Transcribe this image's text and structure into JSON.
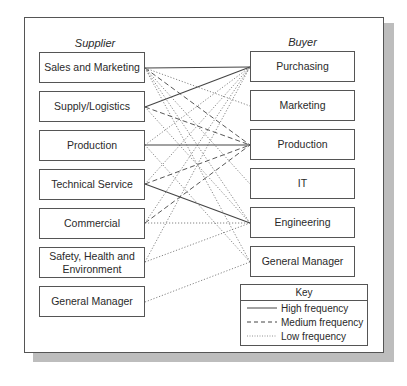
{
  "columns": {
    "supplier_title": "Supplier",
    "buyer_title": "Buyer"
  },
  "suppliers": [
    {
      "label": "Sales and Marketing"
    },
    {
      "label": "Supply/Logistics"
    },
    {
      "label": "Production"
    },
    {
      "label": "Technical Service"
    },
    {
      "label": "Commercial"
    },
    {
      "label": "Safety, Health and Environment"
    },
    {
      "label": "General Manager"
    }
  ],
  "buyers": [
    {
      "label": "Purchasing"
    },
    {
      "label": "Marketing"
    },
    {
      "label": "Production"
    },
    {
      "label": "IT"
    },
    {
      "label": "Engineering"
    },
    {
      "label": "General Manager"
    }
  ],
  "links": [
    {
      "from": "Sales and Marketing",
      "to": "Purchasing",
      "frequency": "high"
    },
    {
      "from": "Sales and Marketing",
      "to": "Marketing",
      "frequency": "low"
    },
    {
      "from": "Sales and Marketing",
      "to": "Production",
      "frequency": "medium"
    },
    {
      "from": "Sales and Marketing",
      "to": "IT",
      "frequency": "low"
    },
    {
      "from": "Sales and Marketing",
      "to": "Engineering",
      "frequency": "low"
    },
    {
      "from": "Sales and Marketing",
      "to": "General Manager",
      "frequency": "low"
    },
    {
      "from": "Supply/Logistics",
      "to": "Purchasing",
      "frequency": "high"
    },
    {
      "from": "Supply/Logistics",
      "to": "Production",
      "frequency": "medium"
    },
    {
      "from": "Supply/Logistics",
      "to": "Engineering",
      "frequency": "low"
    },
    {
      "from": "Production",
      "to": "Purchasing",
      "frequency": "low"
    },
    {
      "from": "Production",
      "to": "Production",
      "frequency": "high"
    },
    {
      "from": "Production",
      "to": "General Manager",
      "frequency": "low"
    },
    {
      "from": "Technical Service",
      "to": "Purchasing",
      "frequency": "low"
    },
    {
      "from": "Technical Service",
      "to": "Production",
      "frequency": "medium"
    },
    {
      "from": "Technical Service",
      "to": "Engineering",
      "frequency": "high"
    },
    {
      "from": "Commercial",
      "to": "Purchasing",
      "frequency": "low"
    },
    {
      "from": "Commercial",
      "to": "Production",
      "frequency": "medium"
    },
    {
      "from": "Commercial",
      "to": "Engineering",
      "frequency": "low"
    },
    {
      "from": "Safety, Health and Environment",
      "to": "Purchasing",
      "frequency": "low"
    },
    {
      "from": "Safety, Health and Environment",
      "to": "Engineering",
      "frequency": "low"
    },
    {
      "from": "General Manager",
      "to": "General Manager",
      "frequency": "low"
    }
  ],
  "key": {
    "title": "Key",
    "items": [
      {
        "label": "High frequency",
        "style": "solid"
      },
      {
        "label": "Medium frequency",
        "style": "dashed"
      },
      {
        "label": "Low frequency",
        "style": "dotted"
      }
    ]
  }
}
